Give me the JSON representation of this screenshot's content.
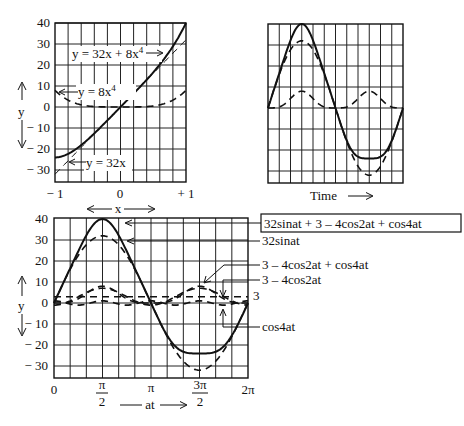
{
  "chart_data": [
    {
      "id": "top_left",
      "type": "line",
      "title": "",
      "xlabel": "",
      "ylabel": "y",
      "xlim": [
        -1,
        1
      ],
      "ylim": [
        -35,
        40
      ],
      "x_ticks": [
        "− 1",
        "0",
        "+ 1"
      ],
      "y_ticks": [
        "40",
        "30",
        "20",
        "10",
        "0",
        "− 10",
        "− 20",
        "− 30"
      ],
      "grid": true,
      "series": [
        {
          "name": "y = 32x + 8x⁴",
          "style": "solid",
          "x": [
            -1,
            -0.75,
            -0.5,
            -0.25,
            0,
            0.25,
            0.5,
            0.75,
            1
          ],
          "values": [
            -24,
            -21.5,
            -15.5,
            -7.97,
            0,
            8.03,
            16.5,
            26.5,
            40
          ]
        },
        {
          "name": "y = 32x",
          "style": "dashed-thin",
          "x": [
            -1,
            -0.5,
            0,
            0.5,
            1
          ],
          "values": [
            -32,
            -16,
            0,
            16,
            32
          ]
        },
        {
          "name": "y = 8x⁴",
          "style": "dashed",
          "x": [
            -1,
            -0.5,
            0,
            0.5,
            1
          ],
          "values": [
            8,
            0.5,
            0,
            0.5,
            8
          ]
        }
      ],
      "annotations": [
        "y = 32x + 8x⁴",
        "y = 8x⁴",
        "y = 32x"
      ]
    },
    {
      "id": "top_right",
      "type": "line",
      "title": "",
      "xlabel": "Time",
      "ylabel": "",
      "xlim": [
        0,
        6.2832
      ],
      "ylim": [
        -35,
        40
      ],
      "grid": true,
      "series": [
        {
          "name": "sum",
          "style": "solid",
          "x": [
            0,
            1.5708,
            3.1416,
            4.7124,
            6.2832
          ],
          "values": [
            0,
            40,
            0,
            -24,
            0
          ]
        },
        {
          "name": "fundamental",
          "style": "dashed",
          "x": [
            0,
            1.5708,
            3.1416,
            4.7124,
            6.2832
          ],
          "values": [
            0,
            32,
            0,
            -32,
            0
          ]
        },
        {
          "name": "harmonic",
          "style": "dashed",
          "x": [
            0,
            1.5708,
            3.1416,
            4.7124,
            6.2832
          ],
          "values": [
            0,
            8,
            0,
            8,
            0
          ]
        }
      ]
    },
    {
      "id": "bottom",
      "type": "line",
      "title": "",
      "xlabel": "at",
      "ylabel": "y",
      "top_label": "x",
      "xlim": [
        0,
        6.2832
      ],
      "ylim": [
        -35,
        40
      ],
      "x_ticks": [
        "0",
        "π/2",
        "π",
        "3π/2",
        "2π"
      ],
      "y_ticks": [
        "40",
        "30",
        "20",
        "10",
        "0",
        "− 10",
        "− 20",
        "− 30"
      ],
      "grid": true,
      "series": [
        {
          "name": "32sinat + 3 – 4cos2at + cos4at",
          "style": "solid",
          "x": [
            0,
            1.5708,
            3.1416,
            4.7124,
            6.2832
          ],
          "values": [
            0,
            40,
            0,
            -24,
            0
          ]
        },
        {
          "name": "32sinat",
          "style": "dashed",
          "x": [
            0,
            1.5708,
            3.1416,
            4.7124,
            6.2832
          ],
          "values": [
            0,
            32,
            0,
            -32,
            0
          ]
        },
        {
          "name": "3 – 4cos2at + cos4at",
          "style": "dashed",
          "x": [
            0,
            1.5708,
            3.1416,
            4.7124,
            6.2832
          ],
          "values": [
            0,
            8,
            0,
            8,
            0
          ]
        },
        {
          "name": "3 – 4cos2at",
          "style": "dashed",
          "x": [
            0,
            1.5708,
            3.1416,
            4.7124,
            6.2832
          ],
          "values": [
            -1,
            7,
            -1,
            7,
            -1
          ]
        },
        {
          "name": "3",
          "style": "dashed",
          "x": [
            0,
            6.2832
          ],
          "values": [
            3,
            3
          ]
        },
        {
          "name": "cos4at",
          "style": "dashed",
          "x": [
            0,
            0.7854,
            1.5708,
            2.3562,
            3.1416
          ],
          "values": [
            1,
            -1,
            1,
            -1,
            1
          ]
        }
      ]
    }
  ],
  "labels": {
    "tl": {
      "y_axis": "y",
      "eq_sum": "y = 32x + 8x",
      "eq_sum_sup": "4",
      "eq_quartic": "y = 8x",
      "eq_quartic_sup": "4",
      "eq_linear": "y = 32x",
      "x_ticks": [
        "− 1",
        "0",
        "+ 1"
      ],
      "y_ticks": [
        "40",
        "30",
        "20",
        "10",
        "0",
        "− 10",
        "− 20",
        "− 30"
      ]
    },
    "tr": {
      "time": "Time"
    },
    "bottom": {
      "x_top": "x",
      "y_axis": "y",
      "at": "at",
      "x_ticks": [
        "0",
        "π",
        "2π"
      ],
      "pi2_num": "π",
      "pi2_den": "2",
      "threepi2_num": "3π",
      "threepi2_den": "2",
      "y_ticks": [
        "40",
        "30",
        "20",
        "10",
        "0",
        "− 10",
        "− 20",
        "− 30"
      ],
      "legend_sum": "32sinat + 3 – 4cos2at + cos4at",
      "legend_fund": "32sinat",
      "legend_h": "3 – 4cos2at + cos4at",
      "legend_h2": "3 – 4cos2at",
      "legend_const": "3",
      "legend_cos4": "cos4at"
    }
  }
}
